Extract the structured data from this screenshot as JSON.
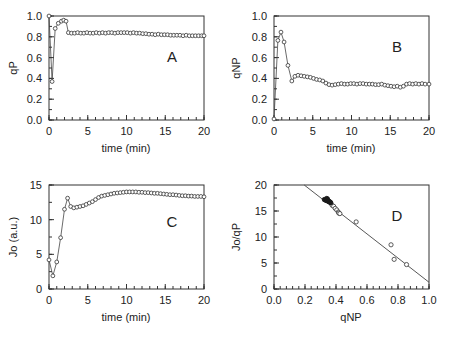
{
  "figure": {
    "background": "#ffffff",
    "line_color": "#444444",
    "marker_edge_color": "#333333",
    "marker_fill_color": "#ffffff",
    "width": 451,
    "height": 341
  },
  "chart_data": [
    {
      "id": "panel-a",
      "type": "line",
      "panel_label": "A",
      "title": "",
      "xlabel": "time  (min)",
      "ylabel": "qP",
      "xlim": [
        0,
        20
      ],
      "ylim": [
        0.0,
        1.0
      ],
      "xticks": [
        0,
        5,
        10,
        15,
        20
      ],
      "xtick_labels": [
        "0",
        "5",
        "10",
        "15",
        "20"
      ],
      "yticks": [
        0.0,
        0.2,
        0.4,
        0.6,
        0.8,
        1.0
      ],
      "ytick_labels": [
        "0.0",
        "0.2",
        "0.4",
        "0.6",
        "0.8",
        "1.0"
      ],
      "grid": false,
      "legend": "none",
      "marker": "open-circle",
      "x": [
        0.0,
        0.4,
        0.8,
        1.2,
        1.6,
        1.9,
        2.2,
        2.5,
        2.9,
        3.3,
        3.7,
        4.1,
        4.5,
        4.9,
        5.3,
        5.7,
        6.1,
        6.5,
        6.9,
        7.3,
        7.7,
        8.1,
        8.5,
        8.9,
        9.3,
        9.7,
        10.1,
        10.5,
        10.9,
        11.3,
        11.7,
        12.1,
        12.5,
        12.9,
        13.3,
        13.7,
        14.1,
        14.5,
        14.9,
        15.3,
        15.7,
        16.1,
        16.5,
        16.9,
        17.3,
        17.7,
        18.1,
        18.5,
        18.9,
        19.3,
        19.7,
        20.0
      ],
      "values": [
        1.0,
        0.37,
        0.88,
        0.93,
        0.95,
        0.96,
        0.95,
        0.84,
        0.835,
        0.835,
        0.84,
        0.835,
        0.835,
        0.84,
        0.835,
        0.835,
        0.84,
        0.835,
        0.84,
        0.835,
        0.84,
        0.84,
        0.835,
        0.84,
        0.84,
        0.84,
        0.84,
        0.835,
        0.84,
        0.835,
        0.835,
        0.83,
        0.83,
        0.825,
        0.825,
        0.82,
        0.825,
        0.82,
        0.82,
        0.82,
        0.815,
        0.815,
        0.815,
        0.815,
        0.81,
        0.815,
        0.81,
        0.81,
        0.81,
        0.81,
        0.81,
        0.81
      ]
    },
    {
      "id": "panel-b",
      "type": "line",
      "panel_label": "B",
      "title": "",
      "xlabel": "time  (min)",
      "ylabel": "qNP",
      "xlim": [
        0,
        20
      ],
      "ylim": [
        0.0,
        1.0
      ],
      "xticks": [
        0,
        5,
        10,
        15,
        20
      ],
      "xtick_labels": [
        "0",
        "5",
        "10",
        "15",
        "20"
      ],
      "yticks": [
        0.0,
        0.2,
        0.4,
        0.6,
        0.8,
        1.0
      ],
      "ytick_labels": [
        "0.0",
        "0.2",
        "0.4",
        "0.6",
        "0.8",
        "1.0"
      ],
      "grid": false,
      "legend": "none",
      "marker": "open-circle",
      "x": [
        0.0,
        0.5,
        0.9,
        1.3,
        1.8,
        2.3,
        2.7,
        3.1,
        3.5,
        3.9,
        4.3,
        4.7,
        5.1,
        5.5,
        5.9,
        6.3,
        6.7,
        7.1,
        7.5,
        7.9,
        8.3,
        8.7,
        9.1,
        9.5,
        9.9,
        10.3,
        10.7,
        11.1,
        11.5,
        11.9,
        12.3,
        12.7,
        13.1,
        13.5,
        13.9,
        14.3,
        14.7,
        15.1,
        15.5,
        15.9,
        16.3,
        16.7,
        17.1,
        17.5,
        17.9,
        18.3,
        18.7,
        19.1,
        19.5,
        20.0
      ],
      "values": [
        0.01,
        0.765,
        0.845,
        0.75,
        0.525,
        0.375,
        0.42,
        0.43,
        0.425,
        0.42,
        0.415,
        0.41,
        0.4,
        0.39,
        0.385,
        0.375,
        0.355,
        0.34,
        0.335,
        0.34,
        0.345,
        0.35,
        0.345,
        0.345,
        0.35,
        0.35,
        0.345,
        0.35,
        0.35,
        0.345,
        0.345,
        0.345,
        0.34,
        0.34,
        0.345,
        0.335,
        0.33,
        0.325,
        0.32,
        0.325,
        0.315,
        0.325,
        0.345,
        0.35,
        0.345,
        0.35,
        0.345,
        0.35,
        0.345,
        0.345
      ]
    },
    {
      "id": "panel-c",
      "type": "line",
      "panel_label": "C",
      "title": "",
      "xlabel": "time  (min)",
      "ylabel": "Jo (a.u.)",
      "xlim": [
        0,
        20
      ],
      "ylim": [
        0,
        15
      ],
      "xticks": [
        0,
        5,
        10,
        15,
        20
      ],
      "xtick_labels": [
        "0",
        "5",
        "10",
        "15",
        "20"
      ],
      "yticks": [
        0,
        5,
        10,
        15
      ],
      "ytick_labels": [
        "0",
        "5",
        "10",
        "15"
      ],
      "grid": false,
      "legend": "none",
      "marker": "open-circle",
      "x": [
        0.0,
        0.5,
        1.0,
        1.5,
        2.0,
        2.4,
        2.8,
        3.2,
        3.6,
        4.0,
        4.4,
        4.8,
        5.2,
        5.6,
        6.0,
        6.4,
        6.8,
        7.2,
        7.6,
        8.0,
        8.4,
        8.8,
        9.2,
        9.6,
        10.0,
        10.4,
        10.8,
        11.2,
        11.6,
        12.0,
        12.4,
        12.8,
        13.2,
        13.6,
        14.0,
        14.4,
        14.8,
        15.2,
        15.6,
        16.0,
        16.4,
        16.8,
        17.2,
        17.6,
        18.0,
        18.4,
        18.8,
        19.2,
        19.6,
        20.0
      ],
      "values": [
        4.2,
        1.9,
        3.9,
        7.4,
        11.5,
        13.1,
        11.9,
        11.7,
        11.8,
        11.9,
        12.0,
        12.2,
        12.4,
        12.6,
        12.9,
        13.2,
        13.4,
        13.5,
        13.6,
        13.7,
        13.8,
        13.85,
        13.9,
        13.95,
        14.0,
        14.0,
        14.0,
        14.0,
        13.95,
        13.95,
        13.9,
        13.9,
        13.85,
        13.8,
        13.8,
        13.75,
        13.7,
        13.65,
        13.6,
        13.6,
        13.55,
        13.5,
        13.45,
        13.45,
        13.4,
        13.4,
        13.35,
        13.35,
        13.35,
        13.3
      ]
    },
    {
      "id": "panel-d",
      "type": "scatter",
      "panel_label": "D",
      "title": "",
      "xlabel": "qNP",
      "ylabel": "Jo/qP",
      "xlim": [
        0.0,
        1.0
      ],
      "ylim": [
        0,
        20
      ],
      "xticks": [
        0.0,
        0.2,
        0.4,
        0.6,
        0.8,
        1.0
      ],
      "xtick_labels": [
        "0.0",
        "0.2",
        "0.4",
        "0.6",
        "0.8",
        "1.0"
      ],
      "yticks": [
        0,
        5,
        10,
        15,
        20
      ],
      "ytick_labels": [
        "0",
        "5",
        "10",
        "15",
        "20"
      ],
      "grid": false,
      "legend": "none",
      "marker": "open-circle",
      "fit_line": {
        "x": [
          0.195,
          1.0
        ],
        "y": [
          20.0,
          1.3
        ]
      },
      "points_open": [
        {
          "x": 0.375,
          "y": 16.1
        },
        {
          "x": 0.385,
          "y": 15.9
        },
        {
          "x": 0.395,
          "y": 15.5
        },
        {
          "x": 0.405,
          "y": 15.2
        },
        {
          "x": 0.415,
          "y": 14.8
        },
        {
          "x": 0.418,
          "y": 14.6
        },
        {
          "x": 0.425,
          "y": 14.5
        },
        {
          "x": 0.53,
          "y": 12.9
        },
        {
          "x": 0.755,
          "y": 8.5
        },
        {
          "x": 0.775,
          "y": 5.7
        },
        {
          "x": 0.855,
          "y": 4.7
        }
      ],
      "points_filled": [
        {
          "x": 0.325,
          "y": 17.2
        },
        {
          "x": 0.332,
          "y": 17.1
        },
        {
          "x": 0.338,
          "y": 17.05
        },
        {
          "x": 0.342,
          "y": 17.0
        },
        {
          "x": 0.346,
          "y": 16.95
        },
        {
          "x": 0.35,
          "y": 16.9
        },
        {
          "x": 0.354,
          "y": 16.85
        },
        {
          "x": 0.358,
          "y": 16.8
        },
        {
          "x": 0.362,
          "y": 16.7
        },
        {
          "x": 0.366,
          "y": 16.6
        },
        {
          "x": 0.345,
          "y": 17.3
        },
        {
          "x": 0.34,
          "y": 17.4
        }
      ]
    }
  ]
}
